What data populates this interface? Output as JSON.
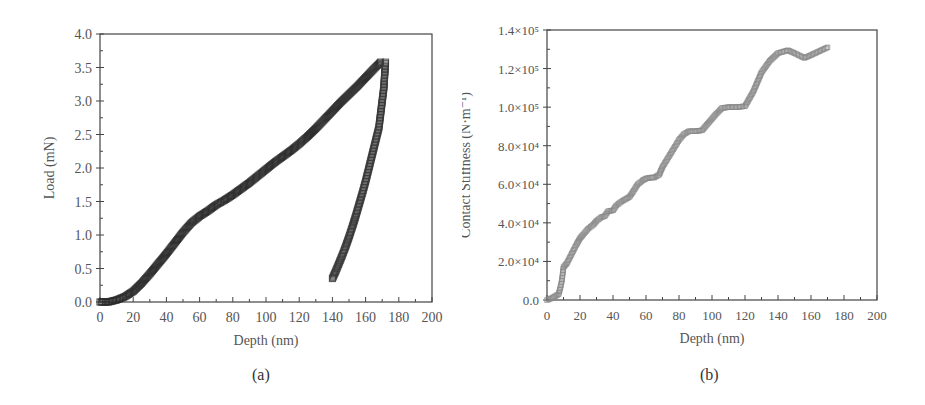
{
  "chart_data": [
    {
      "id": "a",
      "type": "scatter",
      "caption": "(a)",
      "title": "",
      "xlabel": "Depth (nm)",
      "ylabel": "Load (mN)",
      "xlim": [
        0,
        200
      ],
      "ylim": [
        0,
        4.0
      ],
      "xticks": [
        "0",
        "20",
        "40",
        "60",
        "80",
        "100",
        "120",
        "140",
        "160",
        "180",
        "200"
      ],
      "yticks": [
        "0.0",
        "0.5",
        "1.0",
        "1.5",
        "2.0",
        "2.5",
        "3.0",
        "3.5",
        "4.0"
      ],
      "grid": false,
      "legend": null,
      "marker": "square",
      "series": [
        {
          "name": "Loading",
          "color": "#2a2a2a",
          "x": [
            0,
            5,
            10,
            15,
            20,
            25,
            30,
            35,
            40,
            45,
            50,
            55,
            60,
            65,
            70,
            75,
            80,
            85,
            90,
            95,
            100,
            105,
            110,
            115,
            120,
            125,
            130,
            135,
            140,
            145,
            150,
            155,
            160,
            165,
            169
          ],
          "y": [
            0.0,
            0.0,
            0.03,
            0.08,
            0.16,
            0.28,
            0.42,
            0.57,
            0.72,
            0.88,
            1.04,
            1.18,
            1.28,
            1.36,
            1.45,
            1.52,
            1.6,
            1.69,
            1.78,
            1.88,
            1.98,
            2.08,
            2.17,
            2.26,
            2.36,
            2.47,
            2.59,
            2.72,
            2.85,
            2.98,
            3.1,
            3.22,
            3.35,
            3.48,
            3.58
          ]
        },
        {
          "name": "Unloading",
          "color": "#3a3a3a",
          "x": [
            172,
            171.5,
            171,
            170,
            169,
            168,
            166,
            164,
            162,
            160,
            158,
            156,
            154,
            152,
            150,
            148,
            146,
            144,
            142,
            140
          ],
          "y": [
            3.58,
            3.4,
            3.2,
            3.0,
            2.8,
            2.6,
            2.4,
            2.2,
            2.0,
            1.8,
            1.62,
            1.45,
            1.28,
            1.12,
            0.97,
            0.83,
            0.7,
            0.58,
            0.46,
            0.35
          ]
        }
      ]
    },
    {
      "id": "b",
      "type": "scatter",
      "caption": "(b)",
      "title": "",
      "xlabel": "Depth (nm)",
      "ylabel": "Contact Stiffness (N·m⁻¹)",
      "xlim": [
        0,
        200
      ],
      "ylim": [
        0,
        140000
      ],
      "xticks": [
        "0",
        "20",
        "40",
        "60",
        "80",
        "100",
        "120",
        "140",
        "160",
        "180",
        "200"
      ],
      "yticks": [
        "0.0",
        "2.0×10⁴",
        "4.0×10⁴",
        "6.0×10⁴",
        "8.0×10⁴",
        "1.0×10⁵",
        "1.2×10⁵",
        "1.4×10⁵"
      ],
      "grid": false,
      "legend": null,
      "marker": "square",
      "series": [
        {
          "name": "Contact stiffness",
          "color": "#8a8a8a",
          "x": [
            0,
            3,
            5,
            7,
            8,
            9,
            10,
            12,
            15,
            18,
            20,
            22,
            25,
            28,
            30,
            33,
            35,
            37,
            40,
            42,
            45,
            48,
            50,
            52,
            55,
            58,
            60,
            63,
            65,
            68,
            70,
            75,
            80,
            83,
            86,
            90,
            94,
            98,
            102,
            106,
            110,
            115,
            120,
            125,
            130,
            135,
            140,
            146,
            150,
            156,
            160,
            165,
            170
          ],
          "y": [
            0,
            1000,
            2000,
            3000,
            6000,
            10000,
            17000,
            19000,
            24000,
            29000,
            32000,
            34000,
            37000,
            39000,
            41000,
            43000,
            43500,
            46000,
            46500,
            49000,
            51000,
            52500,
            53500,
            56000,
            60000,
            62000,
            63000,
            63500,
            63500,
            65000,
            69000,
            76000,
            83000,
            86000,
            87500,
            87500,
            88000,
            92000,
            96000,
            99500,
            100000,
            100000,
            100500,
            108000,
            118000,
            124000,
            128000,
            129500,
            128000,
            125500,
            127000,
            129000,
            131000
          ]
        }
      ]
    }
  ]
}
